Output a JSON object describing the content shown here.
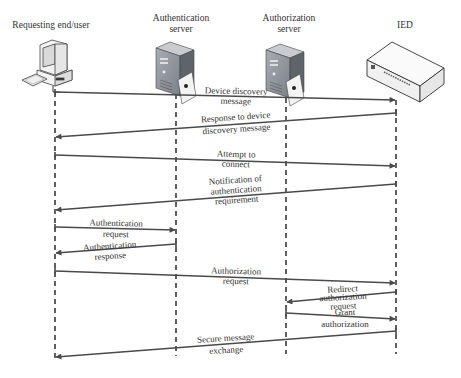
{
  "diagram": {
    "type": "sequence-diagram",
    "actors": [
      {
        "id": "user",
        "label": "Requesting end/user",
        "icon": "desktop-computer-icon",
        "x": 55
      },
      {
        "id": "authn",
        "label_line1": "Authentication",
        "label_line2": "server",
        "icon": "server-tower-icon",
        "x": 176
      },
      {
        "id": "authz",
        "label_line1": "Authorization",
        "label_line2": "server",
        "icon": "server-tower-icon",
        "x": 286
      },
      {
        "id": "ied",
        "label": "IED",
        "icon": "ied-device-box-icon",
        "x": 396
      }
    ],
    "messages": [
      {
        "from": "user",
        "to": "ied",
        "line1": "Device discovery",
        "line2": "message"
      },
      {
        "from": "ied",
        "to": "user",
        "line1": "Response to device",
        "line2": "discovery message"
      },
      {
        "from": "user",
        "to": "ied",
        "line1": "Attempt to",
        "line2": "connect"
      },
      {
        "from": "ied",
        "to": "user",
        "line1": "Notification of",
        "line2": "authentication",
        "line3": "requirement"
      },
      {
        "from": "user",
        "to": "authn",
        "line1": "Authentication",
        "line2": "request"
      },
      {
        "from": "authn",
        "to": "user",
        "line1": "Authentication",
        "line2": "response"
      },
      {
        "from": "user",
        "to": "ied",
        "line1": "Authorization",
        "line2": "request"
      },
      {
        "from": "ied",
        "to": "authz",
        "line1": "Redirect",
        "line2": "authorization",
        "line3": "request"
      },
      {
        "from": "authz",
        "to": "ied",
        "line1": "Grant",
        "line2": "authorization"
      },
      {
        "from": "ied",
        "to": "user",
        "line1": "Secure message",
        "line2": "exchange"
      }
    ],
    "colors": {
      "arrow": "#4a4a4a",
      "lifeline": "#3a3a3a",
      "text": "#333333",
      "server_body": "#8a8f96",
      "server_side": "#5f646b"
    }
  }
}
